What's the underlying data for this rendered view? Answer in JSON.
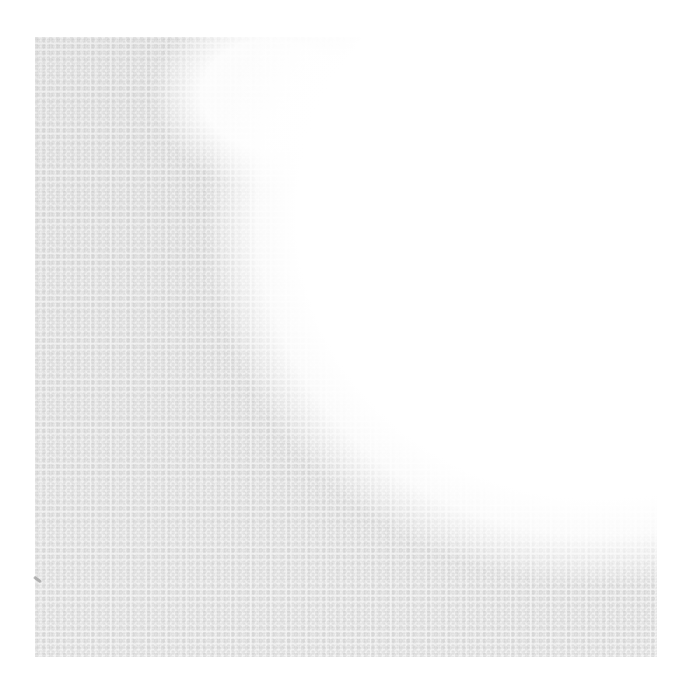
{
  "image": {
    "description": "Faded grainy gray speckled texture on white, resembling a worn print or stamp; no text or UI elements visible",
    "colors": {
      "background": "#ffffff",
      "texture": "#c8c8c8",
      "speck": "#9a9a9a"
    }
  }
}
